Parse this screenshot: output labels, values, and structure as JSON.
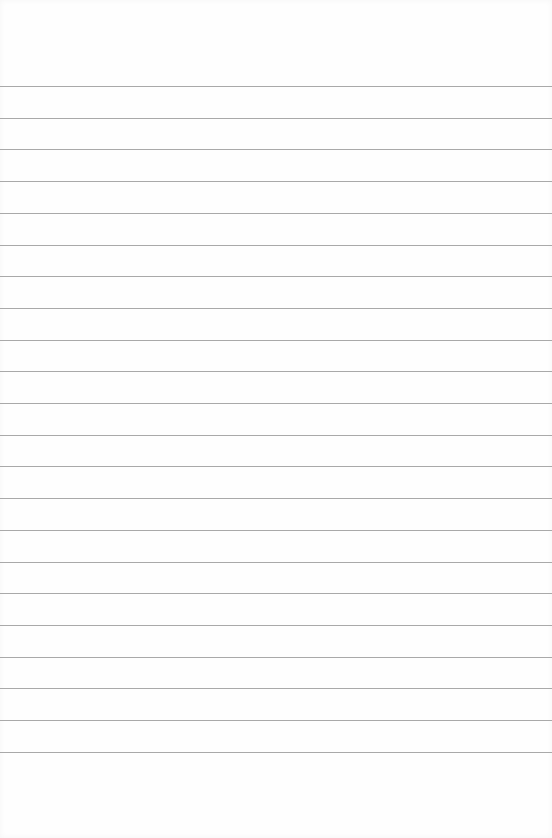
{
  "page": {
    "type": "blank-lined-paper",
    "background_color": "#fefefe",
    "line_color": "#a9a9a9",
    "first_line_y": 86,
    "line_spacing": 31.7,
    "line_count": 22
  }
}
